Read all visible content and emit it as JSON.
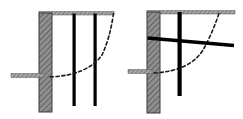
{
  "figure": {
    "title": "Excavation support cross-sections",
    "width": 243,
    "height": 119,
    "background_color": "#ffffff",
    "panel_labels": [
      "",
      ""
    ],
    "colors": {
      "wall_fill": "#8c8c8c",
      "wall_stroke": "#3a3a3a",
      "hatch_stroke": "#555555",
      "pile_fill": "#000000",
      "beam_fill": "#000000",
      "failure_curve": "#1a1a1a",
      "ground_strip_fill": "#9a9a9a"
    }
  },
  "panels": [
    {
      "id": "panel-left",
      "name": "braced-excavation-with-vertical-piles",
      "elements": {
        "retaining_wall": {
          "label": "retaining wall",
          "x": 39,
          "y": 13,
          "width": 13,
          "height": 99,
          "hatch": "diagonal"
        },
        "ground_surface_top": {
          "label": "top ground surface",
          "x1": 39,
          "y1": 14,
          "x2": 113,
          "y2": 14,
          "thickness": 3
        },
        "excavation_level": {
          "label": "excavation level",
          "x1": 11,
          "y1": 76,
          "x2": 44,
          "y2": 76,
          "thickness": 4
        },
        "piles": [
          {
            "label": "pile 1",
            "x": 73,
            "y_top": 14,
            "y_bottom": 106,
            "width": 3
          },
          {
            "label": "pile 2",
            "x": 94,
            "y_top": 14,
            "y_bottom": 106,
            "width": 3
          }
        ],
        "failure_surface": {
          "label": "failure surface (dashed)",
          "style": "dashed",
          "start": [
            50,
            77
          ],
          "control": [
            92,
            73
          ],
          "end": [
            113,
            14
          ]
        }
      }
    },
    {
      "id": "panel-right",
      "name": "anchored-excavation-with-waler-beam",
      "elements": {
        "retaining_wall": {
          "label": "retaining wall",
          "x": 147,
          "y": 12,
          "width": 13,
          "height": 101,
          "hatch": "diagonal"
        },
        "ground_surface_top": {
          "label": "top ground surface",
          "x1": 147,
          "y1": 13,
          "x2": 235,
          "y2": 13,
          "thickness": 3
        },
        "excavation_level": {
          "label": "excavation level",
          "x1": 128,
          "y1": 72,
          "x2": 152,
          "y2": 72,
          "thickness": 4
        },
        "pile": {
          "label": "vertical pile",
          "x": 178,
          "y_top": 13,
          "y_bottom": 96,
          "width": 4
        },
        "waler_beam": {
          "label": "inclined waler / anchor beam",
          "x1": 148,
          "y1": 39,
          "x2": 234,
          "y2": 46,
          "thickness": 4
        },
        "failure_surface": {
          "label": "failure surface (dashed)",
          "style": "dashed",
          "start": [
            154,
            73
          ],
          "control": [
            193,
            69
          ],
          "end": [
            219,
            14
          ]
        }
      }
    }
  ]
}
